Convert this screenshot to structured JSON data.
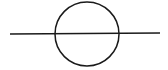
{
  "diagram": {
    "background": "#ffffff",
    "stroke_color": "#1a1a1a",
    "stroke_width": 1.5,
    "circle": {
      "cx": 87,
      "cy": 34,
      "r": 32
    },
    "line": {
      "x1": 10,
      "y1": 34,
      "x2": 160,
      "y2": 33
    }
  }
}
